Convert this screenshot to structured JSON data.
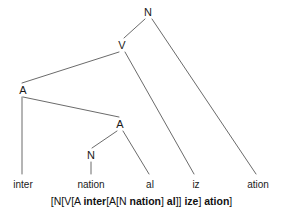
{
  "diagram": {
    "kind": "morphological-tree",
    "line_color": "#6b6b6b",
    "text_color": "#1a1a1a",
    "background_color": "#ffffff"
  },
  "nodes": [
    {
      "id": "n-root",
      "label": "N",
      "x": 148,
      "y": 12
    },
    {
      "id": "n-v",
      "label": "V",
      "x": 122,
      "y": 45
    },
    {
      "id": "n-a-out",
      "label": "A",
      "x": 23,
      "y": 90
    },
    {
      "id": "n-a-in",
      "label": "A",
      "x": 120,
      "y": 124
    },
    {
      "id": "n-n-in",
      "label": "N",
      "x": 91,
      "y": 155
    }
  ],
  "leaves": [
    {
      "id": "leaf-inter",
      "label": "inter",
      "x": 23,
      "y": 180
    },
    {
      "id": "leaf-nation",
      "label": "nation",
      "x": 91,
      "y": 180
    },
    {
      "id": "leaf-al",
      "label": "al",
      "x": 150,
      "y": 180
    },
    {
      "id": "leaf-iz",
      "label": "iz",
      "x": 196,
      "y": 180
    },
    {
      "id": "leaf-ation",
      "label": "ation",
      "x": 258,
      "y": 180
    }
  ],
  "edges": [
    {
      "id": "edge-root-v",
      "from": "n-root",
      "to": "n-v",
      "x1": 145,
      "y1": 19,
      "x2": 124,
      "y2": 38
    },
    {
      "id": "edge-root-ation",
      "from": "n-root",
      "to": "leaf-ation",
      "x1": 152,
      "y1": 19,
      "x2": 256,
      "y2": 174
    },
    {
      "id": "edge-v-a",
      "from": "n-v",
      "to": "n-a-out",
      "x1": 119,
      "y1": 52,
      "x2": 22,
      "y2": 83
    },
    {
      "id": "edge-v-iz",
      "from": "n-v",
      "to": "leaf-iz",
      "x1": 125,
      "y1": 52,
      "x2": 194,
      "y2": 174
    },
    {
      "id": "edge-a-inter",
      "from": "n-a-out",
      "to": "leaf-inter",
      "x1": 22,
      "y1": 97,
      "x2": 22,
      "y2": 174
    },
    {
      "id": "edge-a-ain",
      "from": "n-a-out",
      "to": "n-a-in",
      "x1": 23,
      "y1": 97,
      "x2": 119,
      "y2": 117
    },
    {
      "id": "edge-ain-n",
      "from": "n-a-in",
      "to": "n-n-in",
      "x1": 117,
      "y1": 131,
      "x2": 92,
      "y2": 148
    },
    {
      "id": "edge-ain-al",
      "from": "n-a-in",
      "to": "leaf-al",
      "x1": 123,
      "y1": 131,
      "x2": 149,
      "y2": 174
    },
    {
      "id": "edge-n-nation",
      "from": "n-n-in",
      "to": "leaf-nation",
      "x1": 91,
      "y1": 162,
      "x2": 91,
      "y2": 174
    }
  ],
  "bracket_notation": {
    "full_text": "[N[V[A inter[A[N nation] al]] ize] ation]",
    "segments": [
      {
        "text": "[N[V[A ",
        "bold": false
      },
      {
        "text": "inter",
        "bold": true
      },
      {
        "text": "[A[N ",
        "bold": false
      },
      {
        "text": "nation",
        "bold": true
      },
      {
        "text": "] ",
        "bold": false
      },
      {
        "text": "al",
        "bold": true
      },
      {
        "text": "]] ",
        "bold": false
      },
      {
        "text": "ize",
        "bold": true
      },
      {
        "text": "] ",
        "bold": false
      },
      {
        "text": "ation",
        "bold": true
      },
      {
        "text": "]",
        "bold": false
      }
    ]
  }
}
